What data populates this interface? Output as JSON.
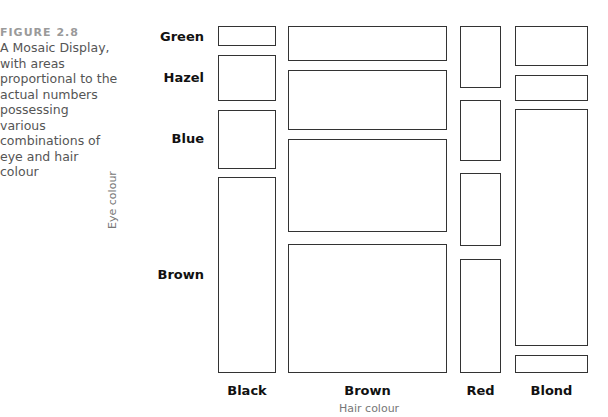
{
  "figure": {
    "label": "FIGURE 2.8",
    "caption": "A Mosaic Display, with areas proportional to the actual numbers possessing various combinations of eye and hair colour"
  },
  "chart_data": {
    "type": "mosaic",
    "title": "",
    "xlabel": "Hair colour",
    "ylabel": "Eye colour",
    "categories": [
      "Black",
      "Brown",
      "Red",
      "Blond"
    ],
    "rows": [
      "Green",
      "Hazel",
      "Blue",
      "Brown"
    ],
    "column_widths_px": [
      58,
      159,
      41,
      73
    ],
    "tiles": [
      {
        "hair": "Black",
        "eye": "Green",
        "x": 218,
        "y": 26,
        "w": 58,
        "h": 20
      },
      {
        "hair": "Black",
        "eye": "Hazel",
        "x": 218,
        "y": 55,
        "w": 58,
        "h": 46
      },
      {
        "hair": "Black",
        "eye": "Blue",
        "x": 218,
        "y": 110,
        "w": 58,
        "h": 59
      },
      {
        "hair": "Black",
        "eye": "Brown",
        "x": 218,
        "y": 177,
        "w": 58,
        "h": 196
      },
      {
        "hair": "Brown",
        "eye": "Green",
        "x": 288,
        "y": 26,
        "w": 159,
        "h": 35
      },
      {
        "hair": "Brown",
        "eye": "Hazel",
        "x": 288,
        "y": 70,
        "w": 159,
        "h": 60
      },
      {
        "hair": "Brown",
        "eye": "Blue",
        "x": 288,
        "y": 139,
        "w": 159,
        "h": 93
      },
      {
        "hair": "Brown",
        "eye": "Brown",
        "x": 288,
        "y": 244,
        "w": 159,
        "h": 129
      },
      {
        "hair": "Red",
        "eye": "Green",
        "x": 460,
        "y": 26,
        "w": 41,
        "h": 62
      },
      {
        "hair": "Red",
        "eye": "Hazel",
        "x": 460,
        "y": 100,
        "w": 41,
        "h": 61
      },
      {
        "hair": "Red",
        "eye": "Blue",
        "x": 460,
        "y": 173,
        "w": 41,
        "h": 73
      },
      {
        "hair": "Red",
        "eye": "Brown",
        "x": 460,
        "y": 259,
        "w": 41,
        "h": 114
      },
      {
        "hair": "Blond",
        "eye": "Green",
        "x": 515,
        "y": 26,
        "w": 73,
        "h": 40
      },
      {
        "hair": "Blond",
        "eye": "Hazel",
        "x": 515,
        "y": 75,
        "w": 73,
        "h": 26
      },
      {
        "hair": "Blond",
        "eye": "Blue",
        "x": 515,
        "y": 109,
        "w": 73,
        "h": 237
      },
      {
        "hair": "Blond",
        "eye": "Brown",
        "x": 515,
        "y": 355,
        "w": 73,
        "h": 18
      }
    ],
    "grid": false,
    "legend": "none"
  },
  "labels": {
    "rows": [
      {
        "text": "Green",
        "y": 29
      },
      {
        "text": "Hazel",
        "y": 70
      },
      {
        "text": "Blue",
        "y": 131
      },
      {
        "text": "Brown",
        "y": 267
      }
    ],
    "cols": [
      {
        "text": "Black",
        "x": 218,
        "w": 58
      },
      {
        "text": "Brown",
        "x": 288,
        "w": 159
      },
      {
        "text": "Red",
        "x": 460,
        "w": 41
      },
      {
        "text": "Blond",
        "x": 515,
        "w": 73
      }
    ]
  }
}
